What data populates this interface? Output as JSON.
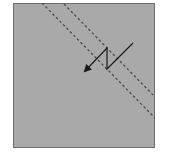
{
  "diagram": {
    "description": "Grey square panel with two parallel dashed diagonal lines and a zig-zag arrow crossing between them",
    "colors": {
      "background": "#a9a9a9",
      "border": "#6e6e6e",
      "dashed_line": "#4a4a4a",
      "arrow": "#1a1a1a",
      "page": "#ffffff"
    },
    "panel": {
      "x": 13,
      "y": 3,
      "width": 142,
      "height": 145
    },
    "dashed_lines": [
      {
        "name": "lower-dashed-line",
        "x1": 42,
        "y1": 3,
        "x2": 155,
        "y2": 118
      },
      {
        "name": "upper-dashed-line",
        "x1": 64,
        "y1": 4,
        "x2": 153,
        "y2": 96
      }
    ],
    "zigzag_arrow": {
      "points": [
        [
          133,
          43
        ],
        [
          107,
          69
        ],
        [
          107,
          48
        ],
        [
          84,
          72
        ]
      ],
      "arrowhead": "at end, pointing down-left"
    }
  }
}
